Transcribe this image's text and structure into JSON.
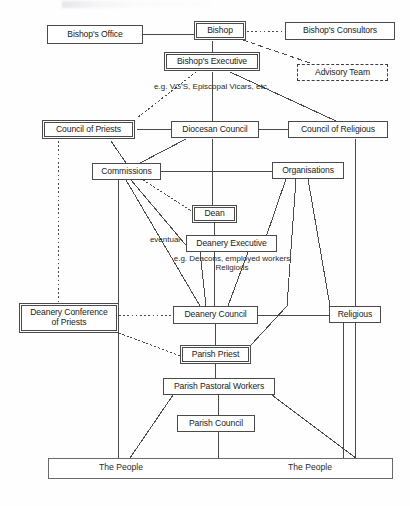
{
  "diagram": {
    "width": 410,
    "height": 506,
    "line_color": "#4a4a4a",
    "text_color": "#1a1a1a",
    "background": "#fefefe",
    "nodes": [
      {
        "id": "bishops-office",
        "label": "Bishop's Office",
        "x": 47,
        "y": 25,
        "w": 96,
        "h": 19,
        "border": "single",
        "font": 8.6
      },
      {
        "id": "bishop",
        "label": "Bishop",
        "x": 194,
        "y": 21,
        "w": 52,
        "h": 19,
        "border": "double",
        "font": 8.6
      },
      {
        "id": "bishops-consultors",
        "label": "Bishop's Consultors",
        "x": 285,
        "y": 22,
        "w": 110,
        "h": 18,
        "border": "single",
        "font": 8.6
      },
      {
        "id": "bishops-executive",
        "label": "Bishop's Executive",
        "x": 164,
        "y": 52,
        "w": 96,
        "h": 19,
        "border": "double",
        "font": 8.6
      },
      {
        "id": "advisory-team",
        "label": "Advisory Team",
        "x": 297,
        "y": 64,
        "w": 91,
        "h": 17,
        "border": "dashed",
        "font": 8.6
      },
      {
        "id": "council-of-priests",
        "label": "Council of Priests",
        "x": 42,
        "y": 120,
        "w": 93,
        "h": 19,
        "border": "double",
        "font": 8.6
      },
      {
        "id": "diocesan-council",
        "label": "Diocesan Council",
        "x": 171,
        "y": 121,
        "w": 88,
        "h": 17,
        "border": "single",
        "font": 8.6
      },
      {
        "id": "council-of-religious",
        "label": "Council of Religious",
        "x": 288,
        "y": 121,
        "w": 100,
        "h": 17,
        "border": "single",
        "font": 8.6
      },
      {
        "id": "commissions",
        "label": "Commissions",
        "x": 92,
        "y": 163,
        "w": 69,
        "h": 17,
        "border": "single",
        "font": 8.6
      },
      {
        "id": "organisations",
        "label": "Organisations",
        "x": 272,
        "y": 162,
        "w": 72,
        "h": 17,
        "border": "single",
        "font": 8.6
      },
      {
        "id": "dean",
        "label": "Dean",
        "x": 192,
        "y": 205,
        "w": 45,
        "h": 18,
        "border": "double",
        "font": 8.6
      },
      {
        "id": "deanery-executive",
        "label": "Deanery Executive",
        "x": 186,
        "y": 235,
        "w": 91,
        "h": 17,
        "border": "single",
        "font": 8.6
      },
      {
        "id": "deanery-conference",
        "label": "Deanery Conference\nof Priests",
        "x": 19,
        "y": 303,
        "w": 100,
        "h": 30,
        "border": "double",
        "font": 8.6
      },
      {
        "id": "deanery-council",
        "label": "Deanery Council",
        "x": 173,
        "y": 306,
        "w": 85,
        "h": 18,
        "border": "single",
        "font": 8.6
      },
      {
        "id": "religious",
        "label": "Religious",
        "x": 329,
        "y": 306,
        "w": 52,
        "h": 17,
        "border": "single",
        "font": 8.6
      },
      {
        "id": "parish-priest",
        "label": "Parish Priest",
        "x": 180,
        "y": 345,
        "w": 71,
        "h": 19,
        "border": "double",
        "font": 8.6
      },
      {
        "id": "parish-pastoral",
        "label": "Parish Pastoral Workers",
        "x": 163,
        "y": 378,
        "w": 112,
        "h": 17,
        "border": "single",
        "font": 8.6
      },
      {
        "id": "parish-council",
        "label": "Parish Council",
        "x": 177,
        "y": 415,
        "w": 78,
        "h": 17,
        "border": "single",
        "font": 8.6
      },
      {
        "id": "the-people-bar",
        "label": "",
        "x": 48,
        "y": 458,
        "w": 345,
        "h": 21,
        "border": "bar",
        "font": 8.6
      }
    ],
    "captions": [
      {
        "id": "caption-vgs",
        "text": "e.g. VG'S, Episcopal Vicars, etc.",
        "x": 134,
        "y": 82,
        "w": 155,
        "font": 8.0
      },
      {
        "id": "caption-eventual",
        "text": "eventual",
        "x": 144,
        "y": 235,
        "w": 42,
        "font": 8.0
      },
      {
        "id": "caption-deacons",
        "text": "e.g. Deacons, employed workers\nReligious",
        "x": 148,
        "y": 254,
        "w": 168,
        "font": 8.0
      },
      {
        "id": "caption-people-left",
        "text": "The People",
        "x": 86,
        "y": 463,
        "w": 70,
        "font": 8.6
      },
      {
        "id": "caption-people-right",
        "text": "The People",
        "x": 275,
        "y": 463,
        "w": 70,
        "font": 8.6
      }
    ],
    "edges": [
      {
        "id": "e-office-bishop",
        "kind": "solid",
        "points": "143,34 194,34"
      },
      {
        "id": "e-bishop-consultors",
        "kind": "dotted",
        "points": "247,31 285,31"
      },
      {
        "id": "e-bishop-advisory",
        "kind": "dashed",
        "points": "243,40 313,64"
      },
      {
        "id": "e-bishop-exec",
        "kind": "solid",
        "points": "212,41 212,52"
      },
      {
        "id": "e-exec-cop",
        "kind": "dotted",
        "points": "196,72 137,118"
      },
      {
        "id": "e-exec-diocesan",
        "kind": "solid",
        "points": "212,72 212,121"
      },
      {
        "id": "e-exec-religious",
        "kind": "solid",
        "points": "230,72 336,121"
      },
      {
        "id": "e-cop-diocesan",
        "kind": "solid",
        "points": "137,129 171,129"
      },
      {
        "id": "e-diocesan-cor",
        "kind": "solid",
        "points": "259,129 288,129"
      },
      {
        "id": "e-cop-commissions",
        "kind": "solid",
        "points": "111,141 126,163"
      },
      {
        "id": "e-diocesan-commissions",
        "kind": "solid",
        "points": "186,139 140,163"
      },
      {
        "id": "e-commissions-orgs",
        "kind": "solid",
        "points": "161,171 272,171"
      },
      {
        "id": "e-cop-down-left",
        "kind": "dotted",
        "points": "58,141 58,303"
      },
      {
        "id": "e-cor-down",
        "kind": "solid",
        "points": "355,139 355,458"
      },
      {
        "id": "e-diocesan-dean",
        "kind": "solid",
        "points": "212,139 212,205"
      },
      {
        "id": "e-comm-deanerycouncil",
        "kind": "solid",
        "points": "126,180 200,306"
      },
      {
        "id": "e-comm-fan-a",
        "kind": "solid",
        "points": "118,180 118,458"
      },
      {
        "id": "e-comm-fan-b",
        "kind": "solid",
        "points": "131,180 190,250"
      },
      {
        "id": "e-comm-dean-dotted",
        "kind": "dotted",
        "points": "143,180 196,214"
      },
      {
        "id": "e-dean-exec",
        "kind": "solid",
        "points": "214,223 214,235"
      },
      {
        "id": "e-exec-deanerycouncil",
        "kind": "solid",
        "points": "214,252 214,306"
      },
      {
        "id": "e-exec-dc-left",
        "kind": "solid",
        "points": "200,252 206,306"
      },
      {
        "id": "e-exec-dc-right",
        "kind": "solid",
        "points": "248,252 228,306"
      },
      {
        "id": "e-orgs-a",
        "kind": "solid",
        "points": "286,179 265,240"
      },
      {
        "id": "e-orgs-b",
        "kind": "solid",
        "points": "296,179 287,306"
      },
      {
        "id": "e-orgs-c",
        "kind": "solid",
        "points": "308,179 330,306"
      },
      {
        "id": "e-dcp-dc",
        "kind": "dotted",
        "points": "119,315 173,315"
      },
      {
        "id": "e-dcp-pp",
        "kind": "dotted",
        "points": "119,333 180,356"
      },
      {
        "id": "e-dc-religious",
        "kind": "solid",
        "points": "258,315 329,315"
      },
      {
        "id": "e-dc-pp",
        "kind": "solid",
        "points": "215,324 215,345"
      },
      {
        "id": "e-pp-up-right",
        "kind": "solid",
        "points": "251,345 287,306"
      },
      {
        "id": "e-pp-ppw",
        "kind": "solid",
        "points": "215,364 215,378"
      },
      {
        "id": "e-ppw-pc",
        "kind": "solid",
        "points": "218,395 218,458"
      },
      {
        "id": "e-ppw-left",
        "kind": "solid",
        "points": "173,395 130,458"
      },
      {
        "id": "e-ppw-right",
        "kind": "solid",
        "points": "272,395 356,458"
      },
      {
        "id": "e-religious-down",
        "kind": "solid",
        "points": "343,323 343,458"
      }
    ]
  }
}
